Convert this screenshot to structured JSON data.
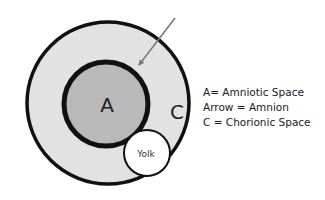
{
  "diagram": {
    "type": "embryonic-sac-diagram",
    "labels": {
      "inner": "A",
      "outer": "C",
      "yolk": "Yolk"
    },
    "legend": [
      {
        "text": "A= Amniotic Space"
      },
      {
        "text": "Arrow = Amnion"
      },
      {
        "text": "C = Chorionic Space"
      }
    ],
    "colors": {
      "outer_fill": "#e2e2e2",
      "inner_fill": "#b9b9b9",
      "yolk_fill": "#ffffff",
      "stroke": "#111111",
      "arrow": "#7a7a7a"
    }
  }
}
